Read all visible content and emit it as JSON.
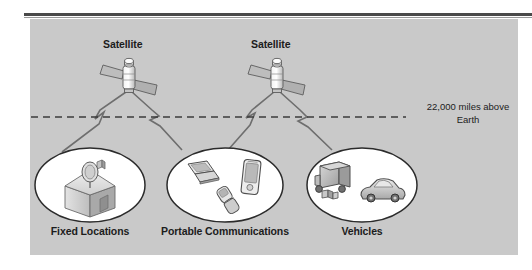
{
  "figure": {
    "type": "satellite-communications-diagram",
    "background_color": "#c9c9c9",
    "page_background": "#ffffff",
    "rule_color": "#4a4a4a",
    "line_color": "#6e6e6e",
    "ellipse_fill": "#ffffff",
    "ellipse_stroke": "#2b2b2b",
    "text_color": "#1c1c1c"
  },
  "satellites": [
    {
      "label": "Satellite",
      "icon": "satellite-icon"
    },
    {
      "label": "Satellite",
      "icon": "satellite-icon"
    }
  ],
  "altitude": {
    "line_style": "dashed",
    "note_line_1": "22,000 miles above",
    "note_line_2": "Earth",
    "note_full": "22,000 miles above Earth"
  },
  "groups": [
    {
      "label": "Fixed Locations",
      "icons": [
        "house-with-satellite-dish-icon"
      ]
    },
    {
      "label": "Portable Communications",
      "icons": [
        "laptop-icon",
        "flip-phone-icon",
        "pda-handheld-icon"
      ]
    },
    {
      "label": "Vehicles",
      "icons": [
        "delivery-truck-icon",
        "car-icon"
      ]
    }
  ],
  "links": {
    "count": 4,
    "symbol": "lightning-bolt-icon",
    "description": "transmission links between each satellite and two ground groups"
  }
}
